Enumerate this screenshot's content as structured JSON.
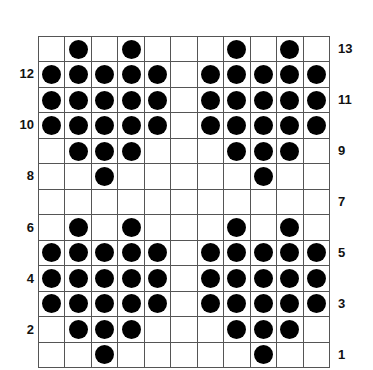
{
  "grid": {
    "columns": 11,
    "rows": 13,
    "dot_color": "#000000",
    "line_color": "#555555",
    "pattern": [
      "01010001010",
      "11111011111",
      "11111011111",
      "11111011111",
      "01110001110",
      "00100000100",
      "00000000000",
      "01010001010",
      "11111011111",
      "11111011111",
      "11111011111",
      "01110001110",
      "00100000100"
    ]
  },
  "row_labels": {
    "left": [
      {
        "row_from_top": 1,
        "text": "12"
      },
      {
        "row_from_top": 3,
        "text": "10"
      },
      {
        "row_from_top": 5,
        "text": "8"
      },
      {
        "row_from_top": 7,
        "text": "6"
      },
      {
        "row_from_top": 9,
        "text": "4"
      },
      {
        "row_from_top": 11,
        "text": "2"
      }
    ],
    "right": [
      {
        "row_from_top": 0,
        "text": "13"
      },
      {
        "row_from_top": 2,
        "text": "11"
      },
      {
        "row_from_top": 4,
        "text": "9"
      },
      {
        "row_from_top": 6,
        "text": "7"
      },
      {
        "row_from_top": 8,
        "text": "5"
      },
      {
        "row_from_top": 10,
        "text": "3"
      },
      {
        "row_from_top": 12,
        "text": "1"
      }
    ]
  }
}
